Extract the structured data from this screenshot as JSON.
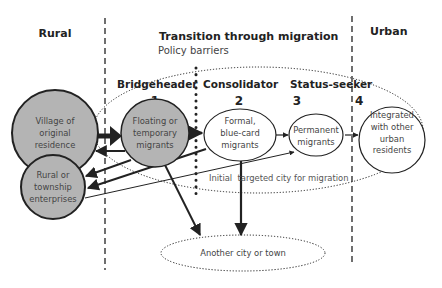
{
  "regions": {
    "rural": "Rural",
    "transition": "Transition through migration",
    "policy": "Policy barriers",
    "urban": "Urban"
  },
  "stages": [
    {
      "label": "Bridgeheader",
      "number": "1"
    },
    {
      "label": "Consolidator",
      "number": "2"
    },
    {
      "label": "Status-seeker",
      "number": "3"
    },
    {
      "label": "",
      "number": "4"
    }
  ],
  "nodes": {
    "village": [
      "Village of",
      "original",
      "residence"
    ],
    "enterprises": [
      "Rural or",
      "township",
      "enterprises"
    ],
    "floating": [
      "Floating or",
      "temporary",
      "migrants"
    ],
    "formal": [
      "Formal,",
      "blue-card",
      "migrants"
    ],
    "permanent": [
      "Permanent",
      "migrants"
    ],
    "integrated": [
      "Integrated",
      "with other",
      "urban",
      "residents"
    ],
    "another_city": "Another city or town"
  },
  "annotations": {
    "initial_city": "Initial  targeted city for migration"
  },
  "colors": {
    "shaded_node": "#b4b4b4",
    "stroke": "#222222",
    "text": "#444444"
  }
}
